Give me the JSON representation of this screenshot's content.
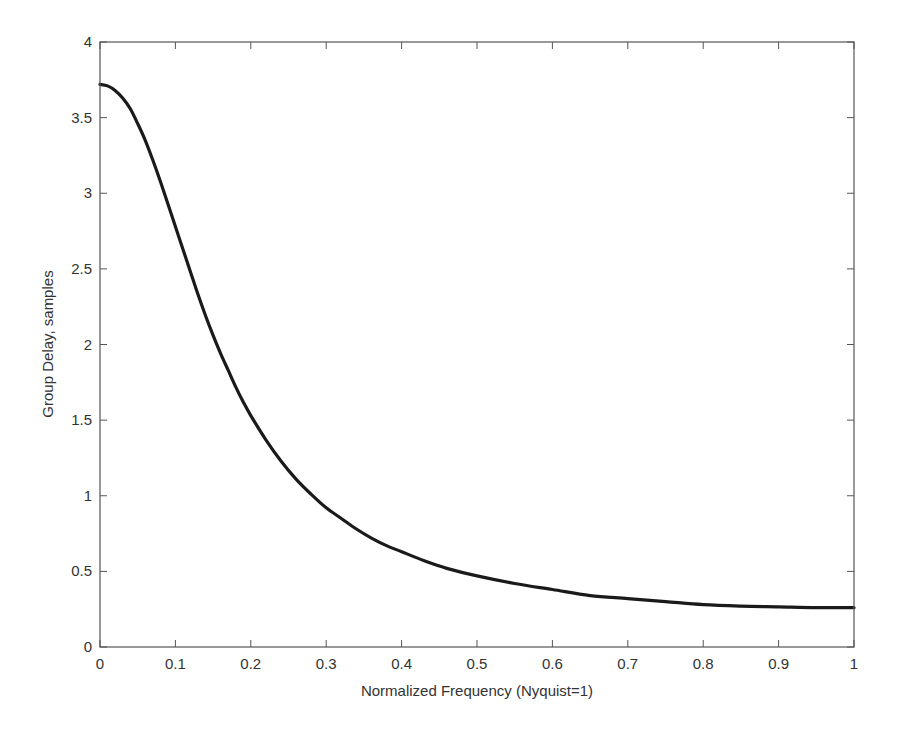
{
  "chart_data": {
    "type": "line",
    "title": "",
    "xlabel": "Normalized Frequency (Nyquist=1)",
    "ylabel": "Group Delay, samples",
    "xlim": [
      0,
      1
    ],
    "ylim": [
      0,
      4
    ],
    "grid": false,
    "legend": null,
    "x_ticks": [
      0,
      0.1,
      0.2,
      0.3,
      0.4,
      0.5,
      0.6,
      0.7,
      0.8,
      0.9,
      1
    ],
    "x_tick_labels": [
      "0",
      "0.1",
      "0.2",
      "0.3",
      "0.4",
      "0.5",
      "0.6",
      "0.7",
      "0.8",
      "0.9",
      "1"
    ],
    "y_ticks": [
      0,
      0.5,
      1,
      1.5,
      2,
      2.5,
      3,
      3.5,
      4
    ],
    "y_tick_labels": [
      "0",
      "0.5",
      "1",
      "1.5",
      "2",
      "2.5",
      "3",
      "3.5",
      "4"
    ],
    "series": [
      {
        "name": "Group Delay",
        "color": "#1a1a1a",
        "x": [
          0,
          0.01,
          0.02,
          0.03,
          0.04,
          0.05,
          0.06,
          0.07,
          0.08,
          0.09,
          0.1,
          0.11,
          0.12,
          0.13,
          0.14,
          0.15,
          0.16,
          0.17,
          0.18,
          0.19,
          0.2,
          0.22,
          0.24,
          0.26,
          0.28,
          0.3,
          0.32,
          0.34,
          0.36,
          0.38,
          0.4,
          0.43,
          0.46,
          0.5,
          0.55,
          0.6,
          0.65,
          0.7,
          0.75,
          0.8,
          0.85,
          0.9,
          0.95,
          1.0
        ],
        "y": [
          3.72,
          3.71,
          3.68,
          3.63,
          3.56,
          3.46,
          3.35,
          3.22,
          3.08,
          2.93,
          2.78,
          2.63,
          2.48,
          2.33,
          2.19,
          2.06,
          1.94,
          1.83,
          1.72,
          1.62,
          1.53,
          1.37,
          1.23,
          1.11,
          1.01,
          0.92,
          0.85,
          0.78,
          0.72,
          0.67,
          0.63,
          0.57,
          0.52,
          0.47,
          0.42,
          0.38,
          0.34,
          0.32,
          0.3,
          0.28,
          0.27,
          0.265,
          0.26,
          0.26
        ]
      }
    ]
  },
  "colors": {
    "axis": "#555555",
    "line": "#1a1a1a",
    "text": "#333333",
    "background": "#ffffff"
  }
}
